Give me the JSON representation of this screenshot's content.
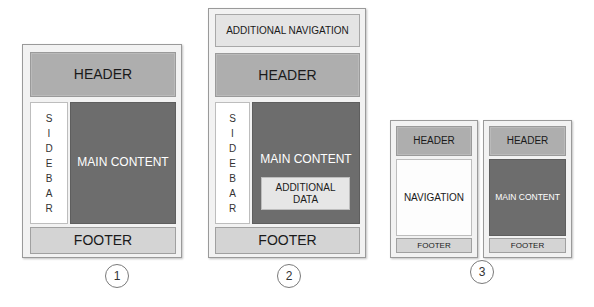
{
  "diagram_title": "Web page layout patterns",
  "colors": {
    "header": "#aeaeae",
    "main_content": "#6d6d6d",
    "footer": "#d4d4d4",
    "sidebar": "#ffffff",
    "additional_navigation": "#e4e4e4",
    "additional_data": "#e6e6e6",
    "frame": "#f2f2f2"
  },
  "layouts": [
    {
      "number": "1",
      "header": "HEADER",
      "sidebar_letters": [
        "S",
        "I",
        "D",
        "E",
        "B",
        "A",
        "R"
      ],
      "main_content": "MAIN CONTENT",
      "footer": "FOOTER"
    },
    {
      "number": "2",
      "additional_navigation": "ADDITIONAL NAVIGATION",
      "header": "HEADER",
      "sidebar_letters": [
        "S",
        "I",
        "D",
        "E",
        "B",
        "A",
        "R"
      ],
      "main_content": "MAIN CONTENT",
      "additional_data_line1": "ADDITIONAL",
      "additional_data_line2": "DATA",
      "footer": "FOOTER"
    },
    {
      "number": "3",
      "screens": [
        {
          "header": "HEADER",
          "body": "NAVIGATION",
          "footer": "FOOTER"
        },
        {
          "header": "HEADER",
          "body": "MAIN CONTENT",
          "footer": "FOOTER"
        }
      ]
    }
  ]
}
